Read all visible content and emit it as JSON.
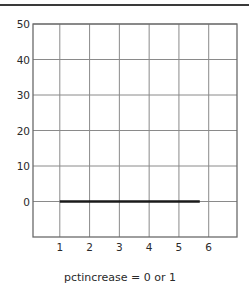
{
  "chart_data": {
    "type": "line",
    "title": "",
    "xlabel": "pctincrease = 0 or 1",
    "ylabel": "",
    "x_ticks": [
      1,
      2,
      3,
      4,
      5,
      6
    ],
    "y_ticks": [
      0,
      10,
      20,
      30,
      40,
      50
    ],
    "xlim": [
      0.1,
      6.95
    ],
    "ylim": [
      -10,
      50
    ],
    "grid": true,
    "legend": null,
    "series": [
      {
        "name": "pctincrease = 0 or 1",
        "x": [
          1,
          5.7
        ],
        "y": [
          0,
          0
        ],
        "color": "#1a1a1a"
      }
    ]
  },
  "caption": "pctincrease = 0 or 1",
  "colors": {
    "grid": "#8a8a8a",
    "frame": "#6a6a6a",
    "line": "#1a1a1a",
    "rule": "#3a3a3a"
  }
}
